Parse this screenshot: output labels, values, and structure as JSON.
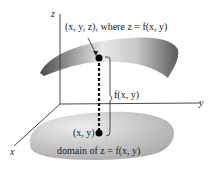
{
  "axes": {
    "z": "z",
    "y": "y",
    "x": "x"
  },
  "labels": {
    "point3d": "(x, y, z), where z = f(x, y)",
    "height": "f(x, y)",
    "point2d": "(x, y)",
    "domain": "domain of z = f(x, y)"
  },
  "colors": {
    "surface_dark": "#555555",
    "surface_light": "#f0f0f0",
    "domain": "#bdbdbd",
    "axis": "#333333"
  }
}
